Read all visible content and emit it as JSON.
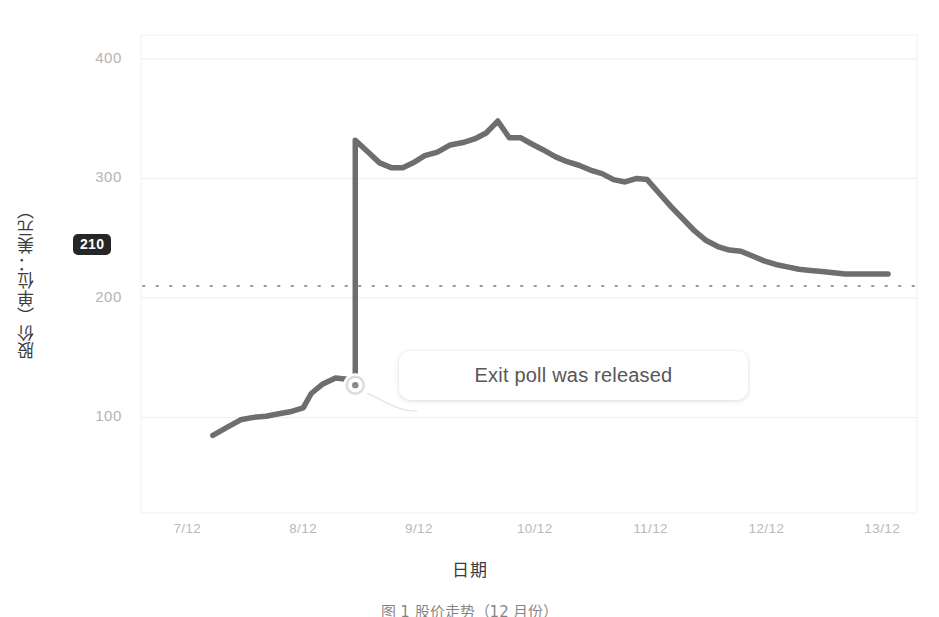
{
  "chart_data": {
    "type": "line",
    "title": "",
    "xlabel": "日期",
    "ylabel": "股价（单位：美元）",
    "xlim": [
      6.6,
      13.3
    ],
    "ylim": [
      20,
      420
    ],
    "grid": true,
    "grid_axis": "y",
    "legend": "none",
    "line_color": "#6e6e6e",
    "x_tick_labels": [
      "7/12",
      "8/12",
      "9/12",
      "10/12",
      "11/12",
      "12/12",
      "13/12"
    ],
    "x_tick_values": [
      7,
      8,
      9,
      10,
      11,
      12,
      13
    ],
    "y_tick_labels": [
      "100",
      "200",
      "300",
      "400"
    ],
    "y_tick_values": [
      100,
      200,
      300,
      400
    ],
    "series": [
      {
        "name": "股价",
        "x": [
          7.22,
          7.35,
          7.46,
          7.57,
          7.68,
          7.79,
          7.9,
          8.0,
          8.07,
          8.17,
          8.28,
          8.38,
          8.45,
          8.45,
          8.56,
          8.66,
          8.76,
          8.86,
          8.95,
          9.05,
          9.16,
          9.27,
          9.38,
          9.48,
          9.58,
          9.68,
          9.78,
          9.88,
          9.97,
          10.07,
          10.18,
          10.28,
          10.38,
          10.48,
          10.58,
          10.68,
          10.78,
          10.88,
          10.97,
          11.07,
          11.18,
          11.28,
          11.38,
          11.48,
          11.58,
          11.68,
          11.78,
          11.88,
          11.98,
          12.08,
          12.18,
          12.28,
          12.38,
          12.48,
          12.58,
          12.68,
          12.78,
          12.88,
          12.98,
          13.05
        ],
        "y": [
          85,
          92,
          98,
          100,
          101,
          103,
          105,
          108,
          120,
          128,
          133,
          132,
          127,
          332,
          322,
          313,
          309,
          309,
          313,
          319,
          322,
          328,
          330,
          333,
          338,
          348,
          334,
          334,
          329,
          324,
          318,
          314,
          311,
          307,
          304,
          299,
          297,
          300,
          299,
          288,
          276,
          266,
          256,
          248,
          243,
          240,
          239,
          235,
          231,
          228,
          226,
          224,
          223,
          222,
          221,
          220,
          220,
          220,
          220,
          220
        ]
      }
    ],
    "reference_line": {
      "value": 210,
      "label": "210",
      "style": "dotted",
      "color": "#9a9a9a",
      "badge_bg": "#262626",
      "badge_fg": "#ffffff"
    },
    "annotation": {
      "text": "Exit poll was released",
      "marker_x": 8.45,
      "marker_y": 127,
      "marker_style": "circle-outline"
    }
  },
  "caption": {
    "text": "图 1    股价走势（12 月份）"
  }
}
